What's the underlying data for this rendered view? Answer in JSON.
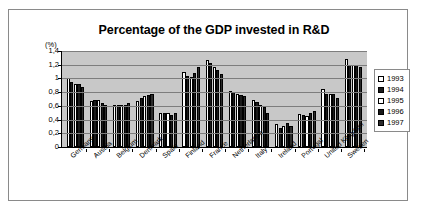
{
  "chart": {
    "title": "Percentage of the GDP invested in R&D",
    "unit_label": "(%)"
  },
  "legend": {
    "entries": [
      {
        "label": "1993",
        "fill": "white"
      },
      {
        "label": "1994",
        "fill": "black"
      },
      {
        "label": "1995",
        "fill": "white"
      },
      {
        "label": "1996",
        "fill": "black"
      },
      {
        "label": "1997",
        "fill": "dark"
      }
    ]
  },
  "chart_data": {
    "type": "bar",
    "title": "Percentage of the GDP invested in R&D",
    "xlabel": "",
    "ylabel": "(%)",
    "ylim": [
      0,
      1.4
    ],
    "ytick_labels": [
      "0",
      "0,2",
      "0,4",
      "0,6",
      "0,8",
      "1",
      "1,2",
      "1,4"
    ],
    "ytick_values": [
      0,
      0.2,
      0.4,
      0.6,
      0.8,
      1.0,
      1.2,
      1.4
    ],
    "grid": true,
    "legend_position": "right",
    "categories": [
      "Germany",
      "Austria",
      "Belgium",
      "Denmark",
      "Spain",
      "Finland",
      "France",
      "Netherlands",
      "Italy",
      "Ireland",
      "Portugal",
      "United Kingdom",
      "Sweden"
    ],
    "series": [
      {
        "name": "1993",
        "fill": "white",
        "values": [
          1.0,
          0.67,
          0.61,
          0.67,
          0.49,
          1.09,
          1.27,
          0.82,
          0.69,
          0.33,
          0.48,
          0.85,
          1.29
        ]
      },
      {
        "name": "1994",
        "fill": "black",
        "values": [
          0.95,
          0.69,
          0.62,
          0.71,
          0.49,
          1.04,
          1.22,
          0.8,
          0.66,
          0.28,
          0.47,
          0.78,
          1.2
        ]
      },
      {
        "name": "1995",
        "fill": "white",
        "values": [
          0.92,
          0.68,
          0.61,
          0.75,
          0.49,
          1.02,
          1.16,
          0.78,
          0.62,
          0.31,
          0.45,
          0.78,
          1.2
        ]
      },
      {
        "name": "1996",
        "fill": "black",
        "values": [
          0.92,
          0.64,
          0.62,
          0.76,
          0.46,
          1.08,
          1.12,
          0.76,
          0.58,
          0.35,
          0.5,
          0.78,
          1.19
        ]
      },
      {
        "name": "1997",
        "fill": "dark",
        "values": [
          0.87,
          0.62,
          0.64,
          0.77,
          0.49,
          1.16,
          1.06,
          0.75,
          0.5,
          0.31,
          0.53,
          0.72,
          1.16
        ]
      }
    ]
  }
}
